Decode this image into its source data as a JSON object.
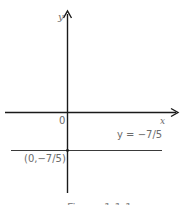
{
  "diagram": {
    "type": "coordinate-plane",
    "axes": {
      "x_label": "x",
      "y_label": "y",
      "origin_label": "0"
    },
    "line": {
      "equation_label": "y = −7/5",
      "slope": 0,
      "y_intercept": -1.4
    },
    "point": {
      "label": "(0,−7/5)",
      "x": 0,
      "y": -1.4
    },
    "caption": "Figure 1.1.1"
  },
  "colors": {
    "axis": "#1a1a1a",
    "line": "#3a3a3a",
    "text": "#6b6b6b",
    "background": "#ffffff"
  }
}
